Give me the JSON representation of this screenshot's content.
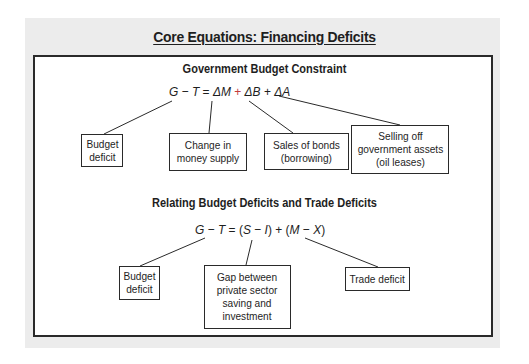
{
  "title": "Core Equations: Financing Deficits",
  "sections": [
    {
      "heading": "Government Budget Constraint",
      "equation": {
        "G": "G",
        "minus": "−",
        "T": "T",
        "equals": "=",
        "dM": "ΔM",
        "plus1": "+",
        "dB": "ΔB",
        "plus2": "+",
        "dA": "ΔA"
      },
      "boxes": [
        {
          "label": "Budget\ndeficit"
        },
        {
          "label": "Change in\nmoney supply"
        },
        {
          "label": "Sales of bonds\n(borrowing)"
        },
        {
          "label": "Selling off\ngovernment assets\n(oil leases)"
        }
      ]
    },
    {
      "heading": "Relating Budget Deficits and Trade Deficits",
      "equation": {
        "G": "G",
        "minus1": "−",
        "T": "T",
        "equals": "=",
        "lp1": "(",
        "S": "S",
        "minus2": "−",
        "I": "I",
        "rp1": ")",
        "plus": "+",
        "lp2": "(",
        "M": "M",
        "minus3": "−",
        "X": "X",
        "rp2": ")"
      },
      "boxes": [
        {
          "label": "Budget\ndeficit"
        },
        {
          "label": "Gap between\nprivate sector\nsaving and\ninvestment"
        },
        {
          "label": "Trade deficit"
        }
      ]
    }
  ],
  "colors": {
    "panel_bg": "#ececec",
    "border": "#2a2a2a",
    "text": "#1e1e1e",
    "plus_accent": "#c23b3b"
  }
}
